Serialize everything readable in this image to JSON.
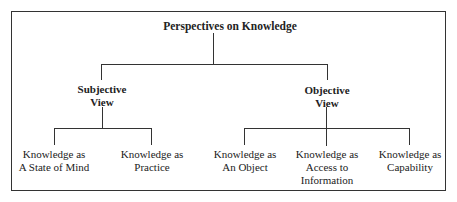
{
  "diagram": {
    "title": "Perspectives on Knowledge",
    "branches": [
      {
        "label_line1": "Subjective",
        "label_line2": "View",
        "children": [
          {
            "line1": "Knowledge as",
            "line2": "A State of Mind"
          },
          {
            "line1": "Knowledge as",
            "line2": "Practice"
          }
        ]
      },
      {
        "label_line1": "Objective",
        "label_line2": "View",
        "children": [
          {
            "line1": "Knowledge as",
            "line2": "An Object"
          },
          {
            "line1": "Knowledge as",
            "line2": "Access to",
            "line3": "Information"
          },
          {
            "line1": "Knowledge as",
            "line2": "Capability"
          }
        ]
      }
    ]
  }
}
